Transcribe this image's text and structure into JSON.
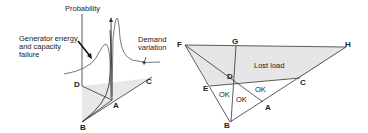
{
  "left_diagram": {
    "axis_label": "Probability",
    "annotation_generator": [
      "Generator energy",
      "and capacity",
      "failure"
    ],
    "annotation_demand": [
      "Demand",
      "variation"
    ],
    "points": {
      "D": "D",
      "A": "A",
      "B": "B",
      "C": "C"
    }
  },
  "right_diagram": {
    "points": {
      "F": "F",
      "G": "G",
      "H": "H",
      "D": "D",
      "E": "E",
      "C": "C",
      "A": "A",
      "B": "B"
    },
    "region_lost_load": "Lost load",
    "region_ok_1": "OK",
    "region_ok_2": "OK",
    "region_ok_3": "OK"
  },
  "colors": {
    "line": "#333333",
    "shade": "#e6e6e6"
  }
}
